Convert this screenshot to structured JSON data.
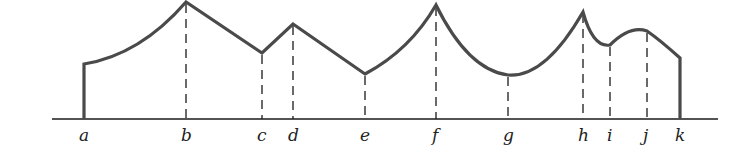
{
  "figure": {
    "width": 733,
    "height": 151,
    "curve_color": "#4a4a4a",
    "line_color": "#1a1a1a",
    "baseline": {
      "y": 119,
      "x1": 52,
      "x2": 718
    },
    "points": [
      {
        "label": "a",
        "x": 84,
        "y": 64
      },
      {
        "label": "b",
        "x": 186,
        "y": 2
      },
      {
        "label": "c",
        "x": 262,
        "y": 53
      },
      {
        "label": "d",
        "x": 293,
        "y": 24
      },
      {
        "label": "e",
        "x": 365,
        "y": 74
      },
      {
        "label": "f",
        "x": 436,
        "y": 5
      },
      {
        "label": "g",
        "x": 508,
        "y": 75
      },
      {
        "label": "h",
        "x": 583,
        "y": 12
      },
      {
        "label": "i",
        "x": 610,
        "y": 45
      },
      {
        "label": "j",
        "x": 647,
        "y": 31
      },
      {
        "label": "k",
        "x": 680,
        "y": 58
      }
    ]
  },
  "labels": {
    "a": "a",
    "b": "b",
    "c": "c",
    "d": "d",
    "e": "e",
    "f": "f",
    "g": "g",
    "h": "h",
    "i": "i",
    "j": "j",
    "k": "k"
  }
}
